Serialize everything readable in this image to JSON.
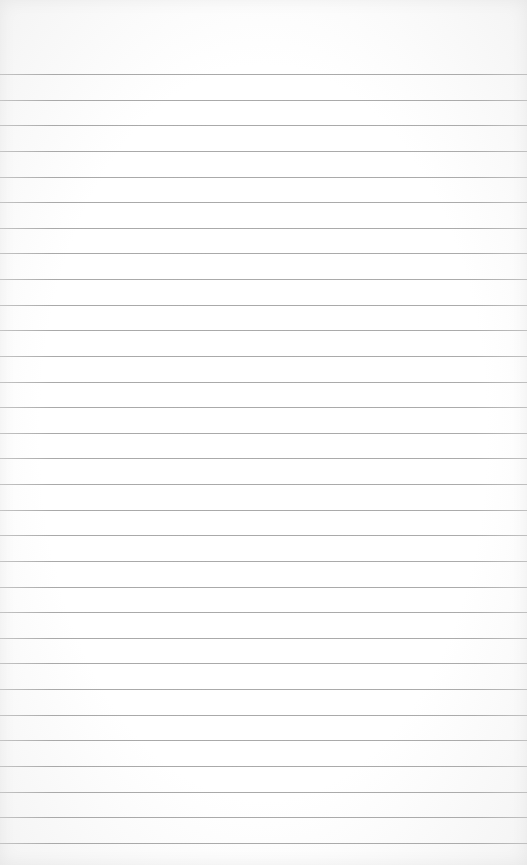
{
  "paper": {
    "background_color": "#ffffff",
    "line_color": "#ababab",
    "line_count": 31,
    "first_line_y": 74,
    "line_spacing": 25.63
  }
}
